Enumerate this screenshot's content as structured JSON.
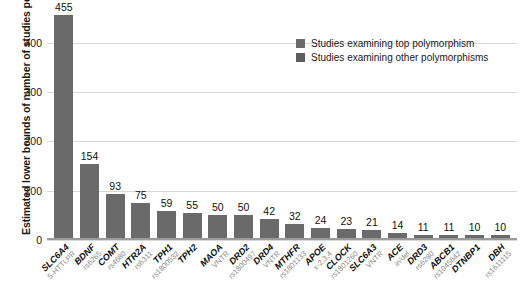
{
  "chart_data": {
    "type": "bar",
    "title": "",
    "xlabel": "",
    "ylabel": "Estimated lower bounds of number of studies per gene",
    "ylim": [
      0,
      470
    ],
    "yticks": [
      0,
      100,
      200,
      300,
      400
    ],
    "grid": true,
    "legend_position": "top-right",
    "categories": [
      "SLC6A4",
      "BDNF",
      "COMT",
      "HTR2A",
      "TPH1",
      "TPH2",
      "MAOA",
      "DRD2",
      "DRD4",
      "MTHFR",
      "APOE",
      "CLOCK",
      "SLC6A3",
      "ACE",
      "DRD3",
      "ABCB1",
      "DTNBP1",
      "DBH"
    ],
    "category_sublabels": [
      "5-HTTLPR",
      "rs6265",
      "rs4680",
      "rs6311",
      "rs1800532",
      "",
      "VNTR",
      "rs1800497",
      "VNTR",
      "rs1801133",
      "ε-2,3,4",
      "rs1801260",
      "VNTR",
      "in/del",
      "rs6280",
      "rs1045642",
      "",
      "rs1611115"
    ],
    "values": [
      455,
      154,
      93,
      75,
      59,
      55,
      50,
      50,
      42,
      32,
      24,
      23,
      21,
      14,
      11,
      11,
      10,
      10
    ],
    "value_labels": [
      "455",
      "154",
      "93",
      "75",
      "59",
      "55",
      "50",
      "50",
      "42",
      "32",
      "24",
      "23",
      "21",
      "14",
      "11",
      "11",
      "10",
      "10"
    ],
    "series": [
      {
        "name": "Studies examining top polymorphism",
        "color": "#6a6a6a",
        "values": [
          455,
          154,
          93,
          75,
          59,
          55,
          50,
          50,
          42,
          32,
          24,
          23,
          21,
          14,
          11,
          11,
          10,
          10
        ]
      },
      {
        "name": "Studies examining other polymorphisms",
        "color": "#5e5e5e",
        "values": [
          0,
          0,
          0,
          0,
          0,
          0,
          0,
          0,
          0,
          0,
          0,
          0,
          0,
          0,
          0,
          0,
          0,
          0
        ]
      }
    ],
    "legend": [
      {
        "label": "Studies examining top polymorphism",
        "color": "#6a6a6a"
      },
      {
        "label": "Studies examining other polymorphisms",
        "color": "#5e5e5e"
      }
    ]
  }
}
